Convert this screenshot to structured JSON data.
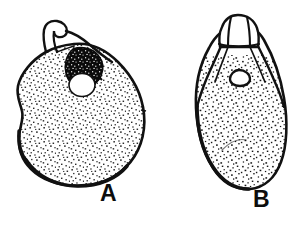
{
  "figure": {
    "kind": "scientific-line-drawing",
    "background_color": "#ffffff",
    "ink_color": "#111111",
    "fill_color": "#ffffff",
    "stipple_color": "#111111",
    "width": 294,
    "height": 232,
    "panels": [
      {
        "id": "A",
        "label": "A",
        "label_x": 100,
        "label_y": 182,
        "description": "broad pear-shaped stippled egg with curved neck at top and dark operculum plug over a round aperture",
        "body_bounds": {
          "x": 15,
          "y": 28,
          "width": 130,
          "height": 158
        },
        "features": [
          {
            "name": "neck-spout",
            "description": "curved tubular neck at top leaning right with rounded open tip"
          },
          {
            "name": "operculum-plug",
            "description": "solid black mass with white internal speckles"
          },
          {
            "name": "aperture-opening",
            "description": "white round opening beneath the dark plug"
          },
          {
            "name": "stipple-fill",
            "description": "dense fine black dot texture covering the body"
          }
        ]
      },
      {
        "id": "B",
        "label": "B",
        "label_x": 253,
        "label_y": 188,
        "description": "narrow elongated stippled egg with ridged crown-like cap at top and small triangular micropyle",
        "body_bounds": {
          "x": 195,
          "y": 14,
          "width": 92,
          "height": 176
        },
        "features": [
          {
            "name": "crown-cap",
            "description": "rounded cap at top with vertical ridge lines and a horizontal band"
          },
          {
            "name": "micropyle-opening",
            "description": "small dark-outlined rounded-triangular opening in the upper body"
          },
          {
            "name": "stipple-fill",
            "description": "dense fine black dot texture covering the body"
          }
        ]
      }
    ]
  }
}
